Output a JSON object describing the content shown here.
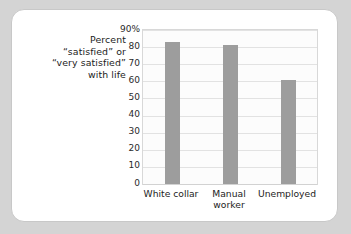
{
  "chart_data": {
    "type": "bar",
    "title": "",
    "ylabel": "Percent “satisfied” or “very satisfied” with life",
    "xlabel": "",
    "categories": [
      "White collar",
      "Manual worker",
      "Unemployed"
    ],
    "values": [
      83,
      81,
      61
    ],
    "ylim": [
      0,
      90
    ],
    "ytick_labels": [
      "90%",
      "80",
      "70",
      "60",
      "50",
      "40",
      "30",
      "20",
      "10",
      "0"
    ],
    "ytick_values": [
      90,
      80,
      70,
      60,
      50,
      40,
      30,
      20,
      10,
      0
    ],
    "grid": true,
    "legend": "none",
    "bar_color": "#9d9d9d",
    "plot_background": "#fcfcfc",
    "gridline_color": "#e2e2e2"
  },
  "axis_caption": {
    "line1": "Percent",
    "line2": "“satisfied” or",
    "line3": "“very satisfied”",
    "line4": "with life"
  },
  "x_labels": [
    {
      "line1": "White collar",
      "line2": ""
    },
    {
      "line1": "Manual",
      "line2": "worker"
    },
    {
      "line1": "Unemployed",
      "line2": ""
    }
  ]
}
